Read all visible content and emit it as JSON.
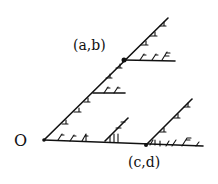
{
  "diagram": {
    "labels": {
      "origin": "O",
      "point_ab": "(a,b)",
      "point_cd": "(c,d)"
    },
    "points": {
      "origin": [
        44,
        140
      ],
      "ab": [
        124,
        60
      ],
      "cd": [
        146,
        145
      ]
    },
    "stroke_color": "#111111",
    "background": "#ffffff"
  }
}
